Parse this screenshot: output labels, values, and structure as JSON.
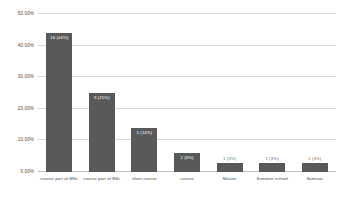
{
  "chart_data": {
    "type": "bar",
    "title": "",
    "subtitle": "",
    "xlabel": "",
    "ylabel": "",
    "categories": [
      "course part of MSc",
      "course part of BSc",
      "short course",
      "course",
      "Master",
      "Summer school",
      "Seminar"
    ],
    "values": [
      44,
      25,
      14,
      6,
      3,
      3,
      3
    ],
    "counts": [
      16,
      9,
      5,
      2,
      1,
      1,
      1
    ],
    "data_labels": [
      "16 (44%)",
      "9 (25%)",
      "5 (14%)",
      "2 (6%)",
      "1 (3%)",
      "1 (3%)",
      "1 (3%)"
    ],
    "ylim": [
      0,
      50
    ],
    "yticks": [
      0,
      10,
      20,
      30,
      40,
      50
    ],
    "ytick_labels": [
      "0.00%",
      "10.00%",
      "20.00%",
      "30.00%",
      "40.00%",
      "50.00%"
    ],
    "grid": true,
    "legend": false,
    "legend_position": "none",
    "bar_color": "#595959",
    "grid_color": "#d9d9d9",
    "background_color": "#ffffff",
    "label_text_color": "#ffffff"
  }
}
